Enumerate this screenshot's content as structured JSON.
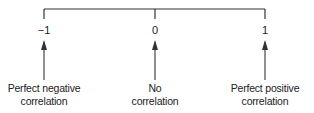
{
  "diagram": {
    "type": "correlation-scale",
    "colors": {
      "line": "#333333",
      "text": "#222222",
      "background": "#ffffff"
    },
    "points": [
      {
        "value": "−1",
        "caption_line1": "Perfect negative",
        "caption_line2": "correlation"
      },
      {
        "value": "0",
        "caption_line1": "No",
        "caption_line2": "correlation"
      },
      {
        "value": "1",
        "caption_line1": "Perfect positive",
        "caption_line2": "correlation"
      }
    ]
  }
}
